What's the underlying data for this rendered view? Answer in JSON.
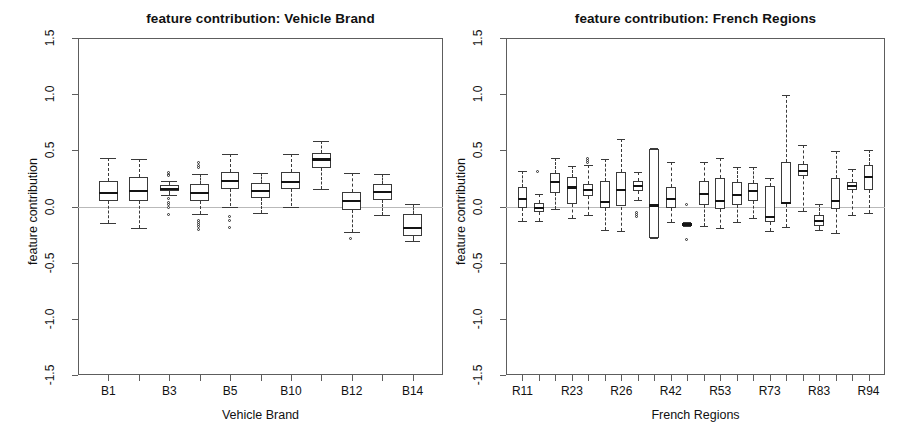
{
  "figure": {
    "width": 908,
    "height": 444,
    "background": "#ffffff",
    "frame_color": "#5d5d5d",
    "zero_line_color": "#b9b9b9",
    "box_color": "#3a3a3a",
    "median_color": "#141414"
  },
  "chart_data": [
    {
      "type": "box",
      "panel": "left",
      "title": "feature contribution: Vehicle Brand",
      "xlabel": "Vehicle Brand",
      "ylabel": "feature contribution",
      "ylim": [
        -1.5,
        1.5
      ],
      "yticks": [
        -1.5,
        -1.0,
        -0.5,
        0.0,
        0.5,
        1.0,
        1.5
      ],
      "ytick_labels": [
        "-1.5",
        "-1.0",
        "-0.5",
        "0.0",
        "0.5",
        "1.0",
        "1.5"
      ],
      "grid": false,
      "legend": "none",
      "zero_reference_line": 0.0,
      "categories": [
        "B1",
        "B2",
        "B3",
        "B4",
        "B5",
        "B6",
        "B10",
        "B11",
        "B12",
        "B13",
        "B14"
      ],
      "xtick_labels_shown": [
        "B1",
        "",
        "B3",
        "",
        "B5",
        "",
        "B10",
        "",
        "B12",
        "",
        "B14"
      ],
      "boxes": [
        {
          "category": "B1",
          "whisker_low": -0.15,
          "q1": 0.05,
          "median": 0.12,
          "q3": 0.23,
          "whisker_high": 0.43,
          "outliers": []
        },
        {
          "category": "B2",
          "whisker_low": -0.19,
          "q1": 0.05,
          "median": 0.14,
          "q3": 0.26,
          "whisker_high": 0.42,
          "outliers": []
        },
        {
          "category": "B3",
          "whisker_low": 0.1,
          "q1": 0.14,
          "median": 0.16,
          "q3": 0.19,
          "whisker_high": 0.23,
          "outliers": [
            0.29,
            0.28,
            0.27,
            0.06,
            0.03,
            0.01,
            -0.02,
            -0.08
          ]
        },
        {
          "category": "B4",
          "whisker_low": -0.07,
          "q1": 0.05,
          "median": 0.12,
          "q3": 0.2,
          "whisker_high": 0.29,
          "outliers": [
            0.38,
            0.36,
            0.34,
            -0.13,
            -0.15,
            -0.17,
            -0.19,
            -0.21
          ]
        },
        {
          "category": "B5",
          "whisker_low": 0.0,
          "q1": 0.16,
          "median": 0.23,
          "q3": 0.31,
          "whisker_high": 0.47,
          "outliers": [
            -0.1,
            -0.13,
            -0.2
          ]
        },
        {
          "category": "B6",
          "whisker_low": -0.06,
          "q1": 0.08,
          "median": 0.14,
          "q3": 0.21,
          "whisker_high": 0.3,
          "outliers": []
        },
        {
          "category": "B10",
          "whisker_low": 0.0,
          "q1": 0.16,
          "median": 0.22,
          "q3": 0.31,
          "whisker_high": 0.47,
          "outliers": []
        },
        {
          "category": "B11",
          "whisker_low": 0.16,
          "q1": 0.34,
          "median": 0.42,
          "q3": 0.48,
          "whisker_high": 0.58,
          "outliers": []
        },
        {
          "category": "B12",
          "whisker_low": -0.23,
          "q1": -0.03,
          "median": 0.05,
          "q3": 0.13,
          "whisker_high": 0.3,
          "outliers": [
            -0.29
          ]
        },
        {
          "category": "B13",
          "whisker_low": -0.08,
          "q1": 0.06,
          "median": 0.13,
          "q3": 0.2,
          "whisker_high": 0.29,
          "outliers": []
        },
        {
          "category": "B14",
          "whisker_low": -0.31,
          "q1": -0.26,
          "median": -0.19,
          "q3": -0.07,
          "whisker_high": 0.02,
          "outliers": []
        }
      ]
    },
    {
      "type": "box",
      "panel": "right",
      "title": "feature contribution: French Regions",
      "xlabel": "French Regions",
      "ylabel": "feature contribution",
      "ylim": [
        -1.5,
        1.5
      ],
      "yticks": [
        -1.5,
        -1.0,
        -0.5,
        0.0,
        0.5,
        1.0,
        1.5
      ],
      "ytick_labels": [
        "-1.5",
        "-1.0",
        "-0.5",
        "0.0",
        "0.5",
        "1.0",
        "1.5"
      ],
      "grid": false,
      "legend": "none",
      "zero_reference_line": 0.0,
      "categories": [
        "R11",
        "R21",
        "R22",
        "R23",
        "R24",
        "R25",
        "R26",
        "R31",
        "R41",
        "R42",
        "R43",
        "R52",
        "R53",
        "R54",
        "R72",
        "R73",
        "R74",
        "R82",
        "R83",
        "R91",
        "R93",
        "R94"
      ],
      "xtick_labels_shown": [
        "R11",
        "",
        "",
        "R23",
        "",
        "",
        "R26",
        "",
        "",
        "R42",
        "",
        "",
        "R53",
        "",
        "",
        "R73",
        "",
        "",
        "R83",
        "",
        "",
        "R94"
      ],
      "boxes": [
        {
          "category": "R11",
          "whisker_low": -0.13,
          "q1": -0.01,
          "median": 0.07,
          "q3": 0.17,
          "whisker_high": 0.32,
          "outliers": []
        },
        {
          "category": "R21",
          "whisker_low": -0.13,
          "q1": -0.05,
          "median": -0.01,
          "q3": 0.03,
          "whisker_high": 0.11,
          "outliers": [
            0.3
          ]
        },
        {
          "category": "R22",
          "whisker_low": -0.02,
          "q1": 0.12,
          "median": 0.22,
          "q3": 0.3,
          "whisker_high": 0.43,
          "outliers": []
        },
        {
          "category": "R23",
          "whisker_low": -0.1,
          "q1": 0.02,
          "median": 0.17,
          "q3": 0.26,
          "whisker_high": 0.36,
          "outliers": []
        },
        {
          "category": "R24",
          "whisker_low": -0.08,
          "q1": 0.09,
          "median": 0.15,
          "q3": 0.2,
          "whisker_high": 0.37,
          "outliers": [
            0.42,
            0.4,
            0.38
          ]
        },
        {
          "category": "R25",
          "whisker_low": -0.21,
          "q1": -0.01,
          "median": 0.04,
          "q3": 0.23,
          "whisker_high": 0.42,
          "outliers": []
        },
        {
          "category": "R26",
          "whisker_low": -0.22,
          "q1": 0.0,
          "median": 0.15,
          "q3": 0.31,
          "whisker_high": 0.6,
          "outliers": []
        },
        {
          "category": "R31",
          "whisker_low": 0.06,
          "q1": 0.14,
          "median": 0.18,
          "q3": 0.23,
          "whisker_high": 0.31,
          "outliers": [
            -0.06,
            -0.08,
            -0.1
          ]
        },
        {
          "category": "R41",
          "whisker_low": -0.28,
          "q1": -0.28,
          "median": 0.01,
          "q3": 0.51,
          "whisker_high": 0.52,
          "outliers": []
        },
        {
          "category": "R42",
          "whisker_low": -0.14,
          "q1": -0.01,
          "median": 0.07,
          "q3": 0.17,
          "whisker_high": 0.4,
          "outliers": []
        },
        {
          "category": "R43",
          "whisker_low": -0.17,
          "q1": -0.17,
          "median": -0.16,
          "q3": -0.15,
          "whisker_high": -0.14,
          "outliers": [
            0.01,
            -0.3
          ]
        },
        {
          "category": "R52",
          "whisker_low": -0.17,
          "q1": 0.01,
          "median": 0.11,
          "q3": 0.23,
          "whisker_high": 0.4,
          "outliers": []
        },
        {
          "category": "R53",
          "whisker_low": -0.19,
          "q1": -0.02,
          "median": 0.05,
          "q3": 0.25,
          "whisker_high": 0.43,
          "outliers": []
        },
        {
          "category": "R54",
          "whisker_low": -0.14,
          "q1": 0.01,
          "median": 0.1,
          "q3": 0.22,
          "whisker_high": 0.35,
          "outliers": []
        },
        {
          "category": "R72",
          "whisker_low": -0.1,
          "q1": 0.05,
          "median": 0.14,
          "q3": 0.21,
          "whisker_high": 0.35,
          "outliers": []
        },
        {
          "category": "R73",
          "whisker_low": -0.22,
          "q1": -0.14,
          "median": -0.09,
          "q3": 0.18,
          "whisker_high": 0.25,
          "outliers": []
        },
        {
          "category": "R74",
          "whisker_low": -0.18,
          "q1": 0.02,
          "median": 0.03,
          "q3": 0.4,
          "whisker_high": 0.99,
          "outliers": []
        },
        {
          "category": "R82",
          "whisker_low": -0.04,
          "q1": 0.27,
          "median": 0.32,
          "q3": 0.38,
          "whisker_high": 0.55,
          "outliers": []
        },
        {
          "category": "R83",
          "whisker_low": -0.21,
          "q1": -0.17,
          "median": -0.13,
          "q3": -0.08,
          "whisker_high": 0.02,
          "outliers": []
        },
        {
          "category": "R91",
          "whisker_low": -0.24,
          "q1": -0.02,
          "median": 0.05,
          "q3": 0.25,
          "whisker_high": 0.49,
          "outliers": []
        },
        {
          "category": "R93",
          "whisker_low": -0.08,
          "q1": 0.15,
          "median": 0.18,
          "q3": 0.22,
          "whisker_high": 0.33,
          "outliers": []
        },
        {
          "category": "R94",
          "whisker_low": -0.06,
          "q1": 0.15,
          "median": 0.26,
          "q3": 0.37,
          "whisker_high": 0.5,
          "outliers": []
        }
      ]
    }
  ]
}
